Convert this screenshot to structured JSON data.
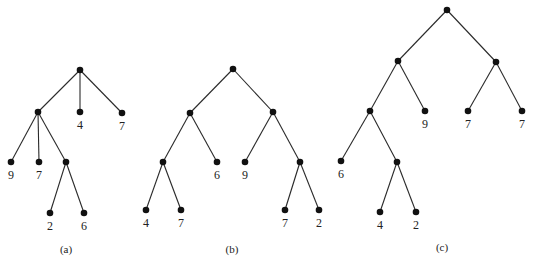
{
  "trees": [
    {
      "caption": "(a)",
      "caption_pos": [
        66,
        253
      ],
      "nodes": [
        {
          "id": "a0",
          "x": 80,
          "y": 70,
          "label": ""
        },
        {
          "id": "a1",
          "x": 38,
          "y": 112,
          "label": ""
        },
        {
          "id": "a2",
          "x": 80,
          "y": 112,
          "label": "4"
        },
        {
          "id": "a3",
          "x": 122,
          "y": 113,
          "label": "7"
        },
        {
          "id": "a4",
          "x": 11,
          "y": 162,
          "label": "9"
        },
        {
          "id": "a5",
          "x": 39,
          "y": 162,
          "label": "7"
        },
        {
          "id": "a6",
          "x": 66,
          "y": 162,
          "label": ""
        },
        {
          "id": "a7",
          "x": 50,
          "y": 213,
          "label": "2"
        },
        {
          "id": "a8",
          "x": 84,
          "y": 213,
          "label": "6"
        }
      ],
      "edges": [
        [
          "a0",
          "a1"
        ],
        [
          "a0",
          "a2"
        ],
        [
          "a0",
          "a3"
        ],
        [
          "a1",
          "a4"
        ],
        [
          "a1",
          "a5"
        ],
        [
          "a1",
          "a6"
        ],
        [
          "a6",
          "a7"
        ],
        [
          "a6",
          "a8"
        ]
      ]
    },
    {
      "caption": "(b)",
      "caption_pos": [
        232,
        253
      ],
      "nodes": [
        {
          "id": "b0",
          "x": 233,
          "y": 69,
          "label": ""
        },
        {
          "id": "b1",
          "x": 190,
          "y": 113,
          "label": ""
        },
        {
          "id": "b2",
          "x": 273,
          "y": 112,
          "label": ""
        },
        {
          "id": "b3",
          "x": 163,
          "y": 162,
          "label": ""
        },
        {
          "id": "b4",
          "x": 217,
          "y": 162,
          "label": "6"
        },
        {
          "id": "b5",
          "x": 245,
          "y": 162,
          "label": "9"
        },
        {
          "id": "b6",
          "x": 300,
          "y": 162,
          "label": ""
        },
        {
          "id": "b7",
          "x": 146,
          "y": 210,
          "label": "4"
        },
        {
          "id": "b8",
          "x": 181,
          "y": 210,
          "label": "7"
        },
        {
          "id": "b9",
          "x": 285,
          "y": 210,
          "label": "7"
        },
        {
          "id": "b10",
          "x": 319,
          "y": 210,
          "label": "2"
        }
      ],
      "edges": [
        [
          "b0",
          "b1"
        ],
        [
          "b0",
          "b2"
        ],
        [
          "b1",
          "b3"
        ],
        [
          "b1",
          "b4"
        ],
        [
          "b2",
          "b5"
        ],
        [
          "b2",
          "b6"
        ],
        [
          "b3",
          "b7"
        ],
        [
          "b3",
          "b8"
        ],
        [
          "b6",
          "b9"
        ],
        [
          "b6",
          "b10"
        ]
      ]
    },
    {
      "caption": "(c)",
      "caption_pos": [
        442,
        251
      ],
      "nodes": [
        {
          "id": "c0",
          "x": 447,
          "y": 10,
          "label": ""
        },
        {
          "id": "c1",
          "x": 398,
          "y": 61,
          "label": ""
        },
        {
          "id": "c2",
          "x": 496,
          "y": 62,
          "label": ""
        },
        {
          "id": "c3",
          "x": 370,
          "y": 111,
          "label": ""
        },
        {
          "id": "c4",
          "x": 425,
          "y": 111,
          "label": "9"
        },
        {
          "id": "c5",
          "x": 468,
          "y": 111,
          "label": "7"
        },
        {
          "id": "c6",
          "x": 522,
          "y": 111,
          "label": "7"
        },
        {
          "id": "c7",
          "x": 341,
          "y": 161,
          "label": "6"
        },
        {
          "id": "c8",
          "x": 397,
          "y": 162,
          "label": ""
        },
        {
          "id": "c9",
          "x": 380,
          "y": 212,
          "label": "4"
        },
        {
          "id": "c10",
          "x": 416,
          "y": 212,
          "label": "2"
        }
      ],
      "edges": [
        [
          "c0",
          "c1"
        ],
        [
          "c0",
          "c2"
        ],
        [
          "c1",
          "c3"
        ],
        [
          "c1",
          "c4"
        ],
        [
          "c2",
          "c5"
        ],
        [
          "c2",
          "c6"
        ],
        [
          "c3",
          "c7"
        ],
        [
          "c3",
          "c8"
        ],
        [
          "c8",
          "c9"
        ],
        [
          "c8",
          "c10"
        ]
      ]
    }
  ]
}
